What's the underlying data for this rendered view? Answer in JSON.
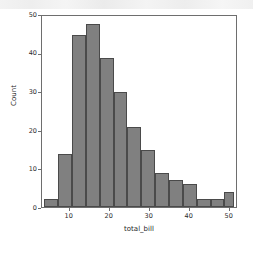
{
  "chart_data": {
    "type": "bar",
    "title": "",
    "subtitle": "",
    "xlabel": "total_bill",
    "ylabel": "Count",
    "grid": false,
    "legend": null,
    "legend_position": "none",
    "xlim": [
      2.5,
      51.5
    ],
    "ylim": [
      0,
      50
    ],
    "xticks": [
      10,
      20,
      30,
      40,
      50
    ],
    "xtick_labels": [
      "10",
      "20",
      "30",
      "40",
      "50"
    ],
    "yticks": [
      0,
      10,
      20,
      30,
      40,
      50
    ],
    "ytick_labels": [
      "0",
      "10",
      "20",
      "30",
      "40",
      "50"
    ],
    "bin_edges": [
      3.07,
      6.57,
      10.07,
      13.57,
      17.07,
      20.57,
      24.07,
      27.57,
      31.07,
      34.57,
      38.07,
      41.57,
      45.07,
      48.57,
      51.07
    ],
    "categories": [
      "3.1-6.6",
      "6.6-10.1",
      "10.1-13.6",
      "13.6-17.1",
      "17.1-20.6",
      "20.6-24.1",
      "24.1-27.6",
      "27.6-31.1",
      "31.1-34.6",
      "34.6-38.1",
      "38.1-41.6",
      "41.6-45.1",
      "45.1-48.6",
      "48.6-51.1"
    ],
    "values": [
      2,
      14,
      45,
      48,
      39,
      30,
      21,
      15,
      9,
      7,
      6,
      2,
      2,
      4
    ],
    "bar_color": "#808080",
    "bar_edge_color": "#4a4a4a",
    "background_color": "#ffffff",
    "axis_color": "#6e6e6e"
  }
}
